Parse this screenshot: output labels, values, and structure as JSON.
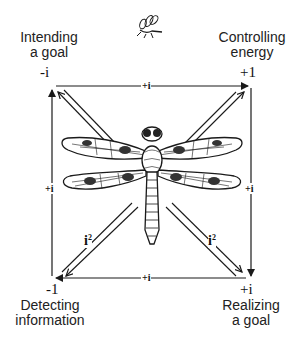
{
  "corners": {
    "top_left": {
      "label_line1": "Intending",
      "label_line2": "a goal",
      "value": "-i"
    },
    "top_right": {
      "label_line1": "Controlling",
      "label_line2": "energy",
      "value": "+1"
    },
    "bottom_left": {
      "label_line1": "Detecting",
      "label_line2": "information",
      "value": "-1"
    },
    "bottom_right": {
      "label_line1": "Realizing",
      "label_line2": "a goal",
      "value": "+i"
    }
  },
  "edges": {
    "top": "+i",
    "left": "+i",
    "right": "+i",
    "bottom": "+i"
  },
  "diagonals": {
    "lower_left_base": "i",
    "lower_left_exp": "2",
    "lower_right_base": "i",
    "lower_right_exp": "2"
  },
  "figures": {
    "center": "dragonfly-illustration",
    "top": "small-insect-illustration"
  },
  "colors": {
    "ink": "#1a1a1a",
    "background": "#ffffff"
  }
}
